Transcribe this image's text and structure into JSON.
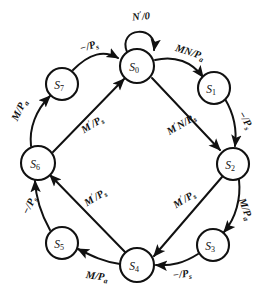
{
  "diagram": {
    "type": "state-transition-diagram",
    "title": "",
    "canvas": {
      "width": 275,
      "height": 298
    },
    "stroke_color": "#111111",
    "fill_color": "#ffffff",
    "states": [
      {
        "id": "S0",
        "base": "S",
        "sub": "0",
        "cx": 137,
        "cy": 66,
        "r": 17
      },
      {
        "id": "S1",
        "base": "S",
        "sub": "1",
        "cx": 214,
        "cy": 88,
        "r": 16
      },
      {
        "id": "S2",
        "base": "S",
        "sub": "2",
        "cx": 233,
        "cy": 164,
        "r": 16
      },
      {
        "id": "S3",
        "base": "S",
        "sub": "3",
        "cx": 213,
        "cy": 245,
        "r": 16
      },
      {
        "id": "S4",
        "base": "S",
        "sub": "4",
        "cx": 137,
        "cy": 265,
        "r": 17
      },
      {
        "id": "S5",
        "base": "S",
        "sub": "5",
        "cx": 62,
        "cy": 243,
        "r": 16
      },
      {
        "id": "S6",
        "base": "S",
        "sub": "6",
        "cx": 38,
        "cy": 163,
        "r": 17
      },
      {
        "id": "S7",
        "base": "S",
        "sub": "7",
        "cx": 62,
        "cy": 84,
        "r": 16
      }
    ],
    "transitions": [
      {
        "from": "S0",
        "to": "S0",
        "label": "N'/0",
        "input": "N'",
        "output": "0",
        "lx": 141,
        "ly": 16
      },
      {
        "from": "S0",
        "to": "S1",
        "label": "MN/Pa",
        "input": "MN",
        "output": "Pa",
        "lx": 189,
        "ly": 52
      },
      {
        "from": "S1",
        "to": "S2",
        "label": "-/Ps",
        "input": "-",
        "output": "Ps",
        "lx": 243,
        "ly": 119
      },
      {
        "from": "S2",
        "to": "S3",
        "label": "M/Pa",
        "input": "M",
        "output": "Pa",
        "lx": 244,
        "ly": 208
      },
      {
        "from": "S3",
        "to": "S4",
        "label": "-/Ps",
        "input": "-",
        "output": "Ps",
        "lx": 181,
        "ly": 272
      },
      {
        "from": "S4",
        "to": "S5",
        "label": "M/Pa",
        "input": "M",
        "output": "Pa",
        "lx": 96,
        "ly": 274
      },
      {
        "from": "S5",
        "to": "S6",
        "label": "-/Ps",
        "input": "-",
        "output": "Ps",
        "lx": 31,
        "ly": 205
      },
      {
        "from": "S6",
        "to": "S7",
        "label": "M/Pa",
        "input": "M",
        "output": "Pa",
        "lx": 20,
        "ly": 110
      },
      {
        "from": "S7",
        "to": "S0",
        "label": "-/Ps",
        "input": "-",
        "output": "Ps",
        "lx": 89,
        "ly": 46
      },
      {
        "from": "S0",
        "to": "S4",
        "label": "M'N/Ps",
        "input": "M'N",
        "output": "Ps",
        "lx": 180,
        "ly": 124
      },
      {
        "from": "S2",
        "to": "S4",
        "label": "M'/Ps",
        "input": "M'",
        "output": "Ps",
        "lx": 182,
        "ly": 198
      },
      {
        "from": "S4",
        "to": "S6",
        "label": "M'/Ps",
        "input": "M'",
        "output": "Ps",
        "lx": 93,
        "ly": 197
      },
      {
        "from": "S6",
        "to": "S0",
        "label": "M'/Ps",
        "input": "M'",
        "output": "Ps",
        "lx": 91,
        "ly": 124
      }
    ]
  }
}
